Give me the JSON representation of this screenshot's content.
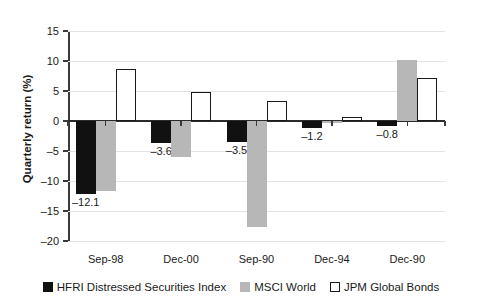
{
  "chart_data": {
    "type": "bar",
    "title": "",
    "subtitle": "",
    "xlabel": "",
    "ylabel": "Quarterly return (%)",
    "ylim": [
      -20,
      15
    ],
    "ytick_step": 5,
    "yticks": [
      "15",
      "10",
      "5",
      "0",
      "–5",
      "–10",
      "–15",
      "–20"
    ],
    "ytick_values": [
      15,
      10,
      5,
      0,
      -5,
      -10,
      -15,
      -20
    ],
    "grid": true,
    "grid_axis": "y",
    "legend_position": "bottom-center",
    "categories": [
      "Sep-98",
      "Dec-00",
      "Sep-90",
      "Dec-94",
      "Dec-90"
    ],
    "series": [
      {
        "name": "HFRI Distressed Securities Index",
        "color": "#111111",
        "values": [
          -12.1,
          -3.6,
          -3.5,
          -1.2,
          -0.8
        ],
        "data_labels": [
          "–12.1",
          "–3.6",
          "–3.5",
          "–1.2",
          "–0.8"
        ]
      },
      {
        "name": "MSCI World",
        "color": "#b7b7b7",
        "values": [
          -11.7,
          -6.0,
          -17.6,
          -0.4,
          10.2
        ],
        "data_labels": [
          "",
          "",
          "",
          "",
          ""
        ]
      },
      {
        "name": "JPM Global Bonds",
        "color": "#ffffff",
        "values": [
          8.6,
          4.8,
          3.3,
          0.6,
          7.2
        ],
        "data_labels": [
          "",
          "",
          "",
          "",
          ""
        ]
      }
    ]
  },
  "legend": {
    "items": [
      {
        "label": "HFRI Distressed Securities Index",
        "swatch": "black-square-icon"
      },
      {
        "label": "MSCI World",
        "swatch": "gray-square-icon"
      },
      {
        "label": "JPM Global Bonds",
        "swatch": "white-square-icon"
      }
    ]
  }
}
